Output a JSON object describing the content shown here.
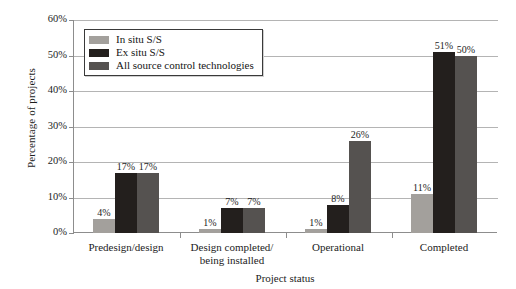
{
  "chart_data": {
    "type": "bar",
    "title": "",
    "xlabel": "Project status",
    "ylabel": "Percentage of projects",
    "ylim": [
      0,
      60
    ],
    "grid": true,
    "legend_position": "top-left",
    "y_ticks": [
      "0%",
      "10%",
      "20%",
      "30%",
      "40%",
      "50%",
      "60%"
    ],
    "y_tick_values": [
      0,
      10,
      20,
      30,
      40,
      50,
      60
    ],
    "categories": [
      "Predesign/design",
      "Design completed/\nbeing installed",
      "Operational",
      "Completed"
    ],
    "category_lines": [
      [
        "Predesign/design",
        ""
      ],
      [
        "Design completed/",
        "being installed"
      ],
      [
        "Operational",
        ""
      ],
      [
        "Completed",
        ""
      ]
    ],
    "series": [
      {
        "name": "In situ S/S",
        "color": "#a3a09c",
        "values": [
          4,
          1,
          1,
          11
        ],
        "labels": [
          "4%",
          "1%",
          "1%",
          "11%"
        ]
      },
      {
        "name": "Ex situ S/S",
        "color": "#231f1d",
        "values": [
          17,
          7,
          8,
          51
        ],
        "labels": [
          "17%",
          "7%",
          "8%",
          "51%"
        ]
      },
      {
        "name": "All source control technologies",
        "color": "#555250",
        "values": [
          17,
          7,
          26,
          50
        ],
        "labels": [
          "17%",
          "7%",
          "26%",
          "50%"
        ]
      }
    ]
  }
}
